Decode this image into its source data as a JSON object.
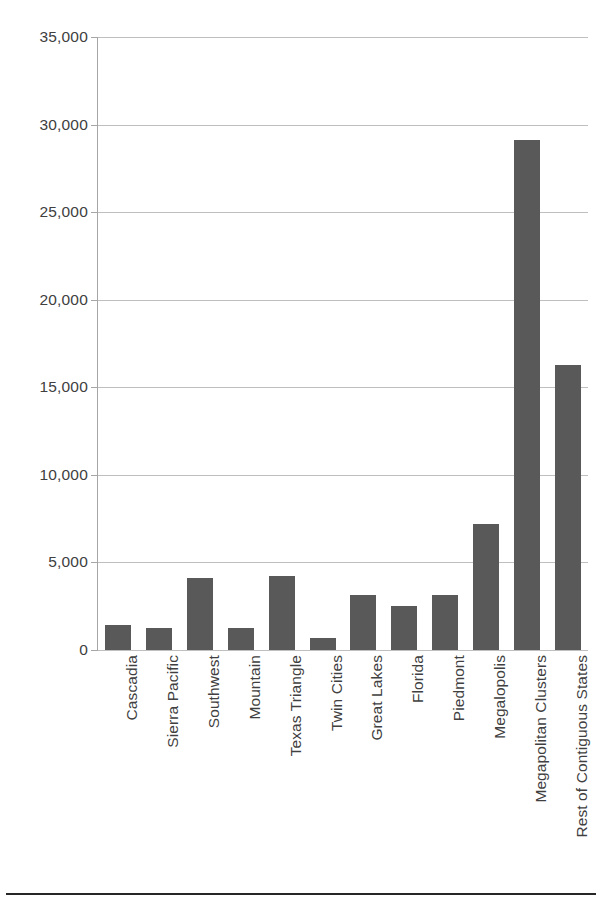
{
  "chart_data": {
    "type": "bar",
    "title": "",
    "subtitle": "",
    "xlabel": "",
    "ylabel": "",
    "ylim": [
      0,
      35000
    ],
    "ytick_labels": [
      "35,000",
      "30,000",
      "25,000",
      "20,000",
      "15,000",
      "10,000",
      "5,000",
      "0"
    ],
    "ytick_values": [
      35000,
      30000,
      25000,
      20000,
      15000,
      10000,
      5000,
      0
    ],
    "grid": "horizontal",
    "legend": "none",
    "bar_color": "#595959",
    "gridline_color": "#bfbfbf",
    "axis_color": "#a6a6a6",
    "categories": [
      "Cascadia",
      "Sierra Pacific",
      "Southwest",
      "Mountain",
      "Texas Triangle",
      "Twin Cities",
      "Great Lakes",
      "Florida",
      "Piedmont",
      "Megalopolis",
      "Megapolitan Clusters",
      "Rest of Contiguous States"
    ],
    "values": [
      1450,
      1250,
      4100,
      1250,
      4250,
      700,
      3150,
      2500,
      3150,
      7200,
      29100,
      16300
    ]
  }
}
